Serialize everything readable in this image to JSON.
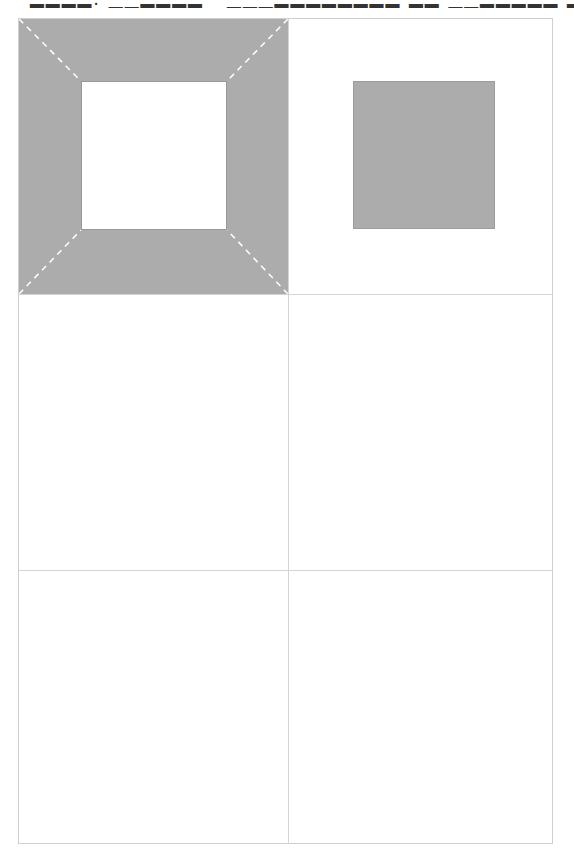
{
  "header": {
    "text": "▂▂▂▂.  ▁▁▂▂▂▂ ·  ▁▁▁▂▂▂▂▂▂▂▂ ▂▂ ▁▁▂▂▂▂▂ ▂▂ · ·"
  },
  "diagram": {
    "grid": {
      "rows": 3,
      "cols": 2
    },
    "colors": {
      "shape_fill": "#acacac",
      "grid_line": "#d4d4d4",
      "dash": "#ffffff"
    },
    "cells": [
      {
        "position": "row1-col1",
        "shape": "square-frame-with-dashed-corner-diagonals"
      },
      {
        "position": "row1-col2",
        "shape": "solid-gray-square"
      },
      {
        "position": "row2-col1",
        "shape": "empty"
      },
      {
        "position": "row2-col2",
        "shape": "empty"
      },
      {
        "position": "row3-col1",
        "shape": "empty"
      },
      {
        "position": "row3-col2",
        "shape": "empty"
      }
    ]
  }
}
